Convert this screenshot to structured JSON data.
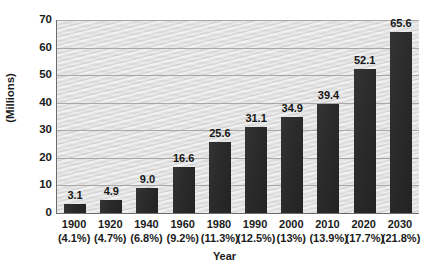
{
  "chart_data": {
    "type": "bar",
    "title": "",
    "xlabel": "Year",
    "ylabel": "(Millions)",
    "categories": [
      "1900",
      "1920",
      "1940",
      "1960",
      "1980",
      "1990",
      "2000",
      "2010",
      "2020",
      "2030"
    ],
    "category_sublabels": [
      "(4.1%)",
      "(4.7%)",
      "(6.8%)",
      "(9.2%)",
      "(11.3%)",
      "(12.5%)",
      "(13%)",
      "(13.9%)",
      "(17.7%)",
      "(21.8%)"
    ],
    "values": [
      3.1,
      4.9,
      9.0,
      16.6,
      25.6,
      31.1,
      34.9,
      39.4,
      52.1,
      65.6
    ],
    "value_labels": [
      "3.1",
      "4.9",
      "9.0",
      "16.6",
      "25.6",
      "31.1",
      "34.9",
      "39.4",
      "52.1",
      "65.6"
    ],
    "ylim": [
      0,
      70
    ],
    "yticks": [
      0,
      10,
      20,
      30,
      40,
      50,
      60,
      70
    ],
    "ytick_labels": [
      "0",
      "10",
      "20",
      "30",
      "40",
      "50",
      "60",
      "70"
    ],
    "grid": true,
    "grid_axis": "y",
    "legend": false,
    "legend_position": "none",
    "bar_color": "#2b2b2b",
    "plot_background_color": "#dcdcdc",
    "gridline_color": "#a8a8a8",
    "axis_color": "#6d6d6d",
    "text_color": "#1b1b1b",
    "figure_background_color": "#ffffff"
  }
}
